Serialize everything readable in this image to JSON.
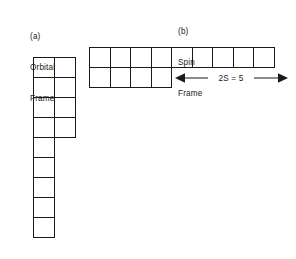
{
  "figure": {
    "background_color": "#ffffff",
    "line_color": "#1a1a1a",
    "panels": [
      {
        "tag": "(a)",
        "name_line1": "Orbital",
        "name_line2": "Frame"
      },
      {
        "tag": "(b)",
        "name_line1": "Spin",
        "name_line2": "Frame"
      }
    ]
  },
  "captions": {
    "orbital": {
      "tag": "(a)",
      "line1": "Orbital",
      "line2": "Frame"
    },
    "spin": {
      "tag": "(b)",
      "line1": "Spin",
      "line2": "Frame"
    }
  },
  "annotations": {
    "spin_measure": "2S = 5"
  },
  "chart_data": {
    "type": "diagram",
    "title": "",
    "subtitle": "",
    "diagram_kind": "young-tableaux-pair",
    "orbital_frame": {
      "label": "(a) Orbital Frame",
      "row_lengths": [
        2,
        2,
        2,
        2,
        1,
        1,
        1,
        1,
        1
      ],
      "rows": 9,
      "columns": 2,
      "total_cells": 13,
      "cell_width": 22,
      "cell_height": 21
    },
    "spin_frame": {
      "label": "(b) Spin Frame",
      "row_lengths": [
        9,
        4
      ],
      "rows": 2,
      "columns": 9,
      "total_cells": 13,
      "cell_width": 21.5,
      "cell_height": 21,
      "annotation": {
        "text": "2S = 5",
        "spans_cells": 5,
        "value": 5,
        "symbol": "2S",
        "arrow_style": "double-headed"
      }
    }
  }
}
